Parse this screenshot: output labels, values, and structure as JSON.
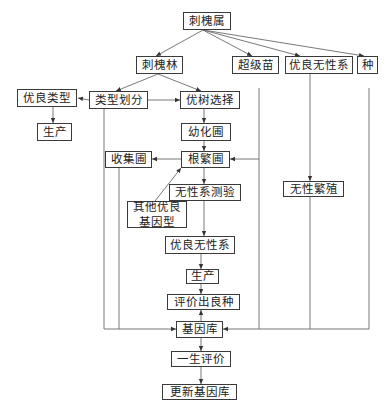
{
  "diagram": {
    "nodes": [
      {
        "id": "genus",
        "label": "刺槐属"
      },
      {
        "id": "forest",
        "label": "刺槐林"
      },
      {
        "id": "super_seedling",
        "label": "超级苗"
      },
      {
        "id": "clone_top",
        "label": "优良无性系"
      },
      {
        "id": "species",
        "label": "种"
      },
      {
        "id": "good_type",
        "label": "优良类型"
      },
      {
        "id": "type_division",
        "label": "类型划分"
      },
      {
        "id": "plus_tree",
        "label": "优树选择"
      },
      {
        "id": "production_1",
        "label": "生产"
      },
      {
        "id": "juvenile_nursery",
        "label": "幼化圃"
      },
      {
        "id": "collection_nursery",
        "label": "收集圃"
      },
      {
        "id": "root_nursery",
        "label": "根繁圃"
      },
      {
        "id": "clone_test",
        "label": "无性系测验"
      },
      {
        "id": "asexual_prop",
        "label": "无性繁殖"
      },
      {
        "id": "other_genotype",
        "label": "其他优良\n基因型"
      },
      {
        "id": "clone_mid",
        "label": "优良无性系"
      },
      {
        "id": "production_2",
        "label": "生产"
      },
      {
        "id": "evaluate_variety",
        "label": "评价出良种"
      },
      {
        "id": "gene_bank",
        "label": "基因库"
      },
      {
        "id": "lifetime_eval",
        "label": "一生评价"
      },
      {
        "id": "update_bank",
        "label": "更新基因库"
      }
    ],
    "edges": [
      {
        "from": "genus",
        "to": "forest"
      },
      {
        "from": "genus",
        "to": "super_seedling"
      },
      {
        "from": "genus",
        "to": "clone_top"
      },
      {
        "from": "genus",
        "to": "species"
      },
      {
        "from": "forest",
        "to": "type_division"
      },
      {
        "from": "forest",
        "to": "plus_tree"
      },
      {
        "from": "type_division",
        "to": "good_type"
      },
      {
        "from": "type_division",
        "to": "plus_tree"
      },
      {
        "from": "good_type",
        "to": "production_1"
      },
      {
        "from": "plus_tree",
        "to": "juvenile_nursery"
      },
      {
        "from": "juvenile_nursery",
        "to": "root_nursery"
      },
      {
        "from": "root_nursery",
        "to": "collection_nursery"
      },
      {
        "from": "super_seedling",
        "to": "root_nursery"
      },
      {
        "from": "other_genotype",
        "to": "root_nursery"
      },
      {
        "from": "root_nursery",
        "to": "clone_test"
      },
      {
        "from": "clone_test",
        "to": "clone_mid"
      },
      {
        "from": "clone_top",
        "to": "asexual_prop"
      },
      {
        "from": "clone_mid",
        "to": "production_2"
      },
      {
        "from": "production_2",
        "to": "evaluate_variety"
      },
      {
        "from": "gene_bank",
        "to": "evaluate_variety"
      },
      {
        "from": "type_division",
        "to": "gene_bank"
      },
      {
        "from": "collection_nursery",
        "to": "gene_bank"
      },
      {
        "from": "super_seedling",
        "to": "gene_bank"
      },
      {
        "from": "asexual_prop",
        "to": "gene_bank"
      },
      {
        "from": "species",
        "to": "gene_bank"
      },
      {
        "from": "gene_bank",
        "to": "lifetime_eval"
      },
      {
        "from": "lifetime_eval",
        "to": "update_bank"
      }
    ]
  }
}
